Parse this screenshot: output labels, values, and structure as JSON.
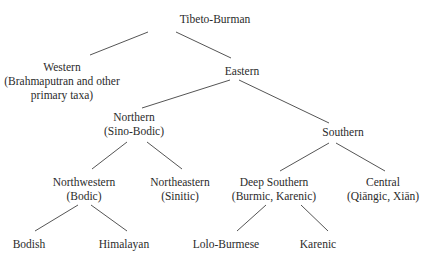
{
  "diagram": {
    "type": "tree",
    "nodes": {
      "root": {
        "label": "Tibeto-Burman",
        "x": 215,
        "y": 12
      },
      "western": {
        "label": "Western",
        "sub": "(Brahmaputran and other",
        "sub2": "primary taxa)",
        "x": 62,
        "y": 60
      },
      "eastern": {
        "label": "Eastern",
        "x": 242,
        "y": 64
      },
      "northern": {
        "label": "Northern",
        "sub": "(Sino-Bodic)",
        "x": 134,
        "y": 110
      },
      "southern": {
        "label": "Southern",
        "x": 343,
        "y": 125
      },
      "northwestern": {
        "label": "Northwestern",
        "sub": "(Bodic)",
        "x": 84,
        "y": 175
      },
      "northeastern": {
        "label": "Northeastern",
        "sub": "(Sinitic)",
        "x": 180,
        "y": 175
      },
      "deep_southern": {
        "label": "Deep Southern",
        "sub": "(Burmic, Karenic)",
        "x": 274,
        "y": 175
      },
      "central": {
        "label": "Central",
        "sub": "(Qiāngic, Xiān)",
        "x": 383,
        "y": 175
      },
      "bodish": {
        "label": "Bodish",
        "x": 29,
        "y": 237
      },
      "himalayan": {
        "label": "Himalayan",
        "x": 124,
        "y": 237
      },
      "lolo_burmese": {
        "label": "Lolo-Burmese",
        "x": 226,
        "y": 237
      },
      "karenic": {
        "label": "Karenic",
        "x": 318,
        "y": 237
      }
    },
    "edges": [
      {
        "from": "root",
        "to": "western",
        "x1": 148,
        "y1": 32,
        "x2": 90,
        "y2": 55
      },
      {
        "from": "root",
        "to": "eastern",
        "x1": 176,
        "y1": 32,
        "x2": 231,
        "y2": 58
      },
      {
        "from": "eastern",
        "to": "northern",
        "x1": 230,
        "y1": 80,
        "x2": 142,
        "y2": 108
      },
      {
        "from": "eastern",
        "to": "southern",
        "x1": 239,
        "y1": 80,
        "x2": 329,
        "y2": 123
      },
      {
        "from": "northern",
        "to": "northwestern",
        "x1": 127,
        "y1": 142,
        "x2": 92,
        "y2": 169
      },
      {
        "from": "northern",
        "to": "northeastern",
        "x1": 147,
        "y1": 142,
        "x2": 182,
        "y2": 169
      },
      {
        "from": "southern",
        "to": "deep_southern",
        "x1": 329,
        "y1": 143,
        "x2": 280,
        "y2": 171
      },
      {
        "from": "southern",
        "to": "central",
        "x1": 336,
        "y1": 143,
        "x2": 385,
        "y2": 171
      },
      {
        "from": "northwestern",
        "to": "bodish",
        "x1": 78,
        "y1": 205,
        "x2": 35,
        "y2": 231
      },
      {
        "from": "northwestern",
        "to": "himalayan",
        "x1": 91,
        "y1": 205,
        "x2": 127,
        "y2": 231
      },
      {
        "from": "deep_southern",
        "to": "lolo_burmese",
        "x1": 266,
        "y1": 205,
        "x2": 237,
        "y2": 231
      },
      {
        "from": "deep_southern",
        "to": "karenic",
        "x1": 301,
        "y1": 205,
        "x2": 328,
        "y2": 231
      }
    ]
  }
}
